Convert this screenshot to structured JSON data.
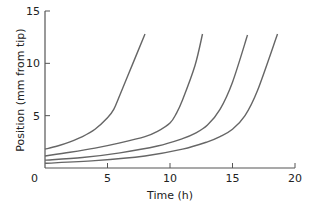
{
  "chart_data": {
    "type": "line",
    "title": "",
    "xlabel": "Time (h)",
    "ylabel": "Position (mm from tip)",
    "xlim": [
      0,
      20
    ],
    "ylim": [
      0,
      15
    ],
    "xticks": [
      0,
      5,
      10,
      15,
      20
    ],
    "yticks": [
      0,
      5,
      10,
      15
    ],
    "grid": false,
    "legend": null,
    "line_color": "#666666",
    "axis_color": "#555555",
    "series": [
      {
        "name": "curve-1",
        "x": [
          0,
          1,
          2,
          3,
          4,
          5,
          5.5,
          6,
          7,
          8
        ],
        "y": [
          1.8,
          2.1,
          2.5,
          3.0,
          3.7,
          4.8,
          5.6,
          7.0,
          9.9,
          12.8
        ]
      },
      {
        "name": "curve-2",
        "x": [
          0,
          2,
          4,
          6,
          8,
          9,
          10,
          10.5,
          11,
          12,
          12.6
        ],
        "y": [
          1.15,
          1.5,
          1.9,
          2.4,
          3.0,
          3.5,
          4.3,
          5.2,
          6.5,
          9.8,
          12.8
        ]
      },
      {
        "name": "curve-3",
        "x": [
          0,
          3,
          6,
          9,
          11,
          12,
          13,
          14,
          15,
          16.2
        ],
        "y": [
          0.75,
          1.0,
          1.45,
          2.1,
          2.8,
          3.3,
          4.1,
          5.6,
          8.2,
          12.7
        ]
      },
      {
        "name": "curve-4",
        "x": [
          0,
          4,
          8,
          11,
          13,
          14,
          15,
          16,
          17,
          18.6
        ],
        "y": [
          0.45,
          0.7,
          1.15,
          1.8,
          2.5,
          3.0,
          3.7,
          5.0,
          7.4,
          12.8
        ]
      }
    ]
  }
}
